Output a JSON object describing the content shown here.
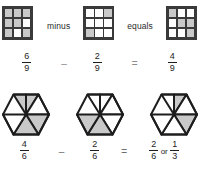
{
  "diagram": {
    "rows": [
      {
        "id": "row-grids",
        "model": "3x3-grid",
        "total_parts": 9,
        "operator_word_1": "minus",
        "operator_word_2": "equals",
        "operator_symbol_1": "–",
        "operator_symbol_2": "=",
        "terms": [
          {
            "name": "minuend",
            "numerator": "6",
            "denominator": "9",
            "shaded_count": 6,
            "cells": [
              1,
              1,
              1,
              1,
              1,
              0,
              1,
              0,
              1
            ]
          },
          {
            "name": "subtrahend",
            "numerator": "2",
            "denominator": "9",
            "shaded_count": 2,
            "cells": [
              0,
              0,
              1,
              0,
              0,
              0,
              1,
              0,
              0
            ]
          },
          {
            "name": "difference",
            "numerator": "4",
            "denominator": "9",
            "shaded_count": 4,
            "cells": [
              1,
              0,
              0,
              0,
              1,
              1,
              0,
              0,
              1
            ]
          }
        ]
      },
      {
        "id": "row-hexagons",
        "model": "hexagon-6-triangles",
        "total_parts": 6,
        "operator_symbol_1": "–",
        "operator_symbol_2": "=",
        "or_word": "or",
        "terms": [
          {
            "name": "minuend",
            "numerator": "4",
            "denominator": "6",
            "shaded_count": 4,
            "triangles": [
              1,
              1,
              0,
              1,
              1,
              0
            ]
          },
          {
            "name": "subtrahend",
            "numerator": "2",
            "denominator": "6",
            "shaded_count": 2,
            "triangles": [
              0,
              0,
              0,
              1,
              0,
              1
            ]
          },
          {
            "name": "difference",
            "numerator": "2",
            "denominator": "6",
            "shaded_count": 2,
            "triangles": [
              1,
              0,
              1,
              0,
              0,
              0
            ],
            "equivalent_numerator": "1",
            "equivalent_denominator": "3"
          }
        ]
      }
    ],
    "colors": {
      "shade_fill": "#c9c9c9",
      "empty_fill": "#ffffff",
      "stroke": "#3a3a3a",
      "text": "#1d1d1d",
      "operator_symbol": "#8a8a8a",
      "background": "#ffffff"
    }
  }
}
